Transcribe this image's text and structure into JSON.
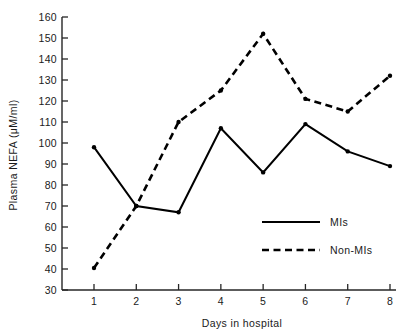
{
  "chart_data": {
    "type": "line",
    "title": "",
    "xlabel": "Days in hospital",
    "ylabel": "Plasma NEFA (μM/ml)",
    "x": [
      1,
      2,
      3,
      4,
      5,
      6,
      7,
      8
    ],
    "xticklabels": [
      "1",
      "2",
      "3",
      "4",
      "5",
      "6",
      "7",
      "8"
    ],
    "yticklabels": [
      "30",
      "40",
      "50",
      "60",
      "70",
      "80",
      "90",
      "100",
      "110",
      "120",
      "130",
      "140",
      "150",
      "160"
    ],
    "yticks": [
      30,
      40,
      50,
      60,
      70,
      80,
      90,
      100,
      110,
      120,
      130,
      140,
      150,
      160
    ],
    "xlim": [
      1,
      8
    ],
    "ylim": [
      30,
      160
    ],
    "grid": false,
    "legend_position": "center-right-inside",
    "series": [
      {
        "name": "MIs",
        "style": "solid",
        "color": "#000000",
        "values": [
          98,
          70,
          67,
          107,
          86,
          109,
          96,
          89
        ]
      },
      {
        "name": "Non-MIs",
        "style": "dashed",
        "color": "#000000",
        "values": [
          40.5,
          70,
          110,
          125,
          152,
          121,
          115,
          132
        ]
      }
    ]
  },
  "legend": {
    "entries": [
      {
        "label": "MIs"
      },
      {
        "label": "Non-MIs"
      }
    ]
  },
  "axes": {
    "y_title": "Plasma NEFA (μM/ml)",
    "x_title": "Days in hospital"
  }
}
